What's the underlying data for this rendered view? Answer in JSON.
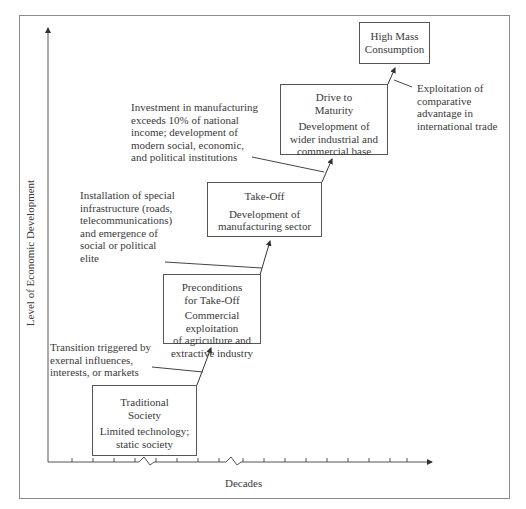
{
  "diagram": {
    "axes": {
      "y_label": "Level of Economic Development",
      "x_label": "Decades"
    },
    "stages": [
      {
        "id": "traditional",
        "title": "Traditional Society",
        "title_lines": [
          "Traditional",
          "Society"
        ],
        "desc_lines": [
          "Limited technology;",
          "static society"
        ]
      },
      {
        "id": "preconditions",
        "title": "Preconditions for Take-Off",
        "title_lines": [
          "Preconditions",
          "for Take-Off"
        ],
        "desc_lines": [
          "Commercial",
          "exploitation",
          "of agriculture and",
          "extractive industry"
        ]
      },
      {
        "id": "takeoff",
        "title": "Take-Off",
        "title_lines": [
          "Take-Off"
        ],
        "desc_lines": [
          "Development of",
          "manufacturing sector"
        ]
      },
      {
        "id": "maturity",
        "title": "Drive to Maturity",
        "title_lines": [
          "Drive to",
          "Maturity"
        ],
        "desc_lines": [
          "Development of",
          "wider industrial and",
          "commercial base"
        ]
      },
      {
        "id": "highmass",
        "title": "High Mass Consumption",
        "title_lines": [
          "High Mass",
          "Consumption"
        ],
        "desc_lines": []
      }
    ],
    "transitions": [
      {
        "from": "traditional",
        "to": "preconditions",
        "lines": [
          "Transition triggered by",
          "exernal influences,",
          "interests, or markets"
        ]
      },
      {
        "from": "preconditions",
        "to": "takeoff",
        "lines": [
          "Installation of special",
          "infrastructure (roads,",
          "telecommunications)",
          "and emergence of",
          "social or political",
          "elite"
        ]
      },
      {
        "from": "takeoff",
        "to": "maturity",
        "lines": [
          "Investment in manufacturing",
          "exceeds 10% of national",
          "income; development of",
          "modern social, economic,",
          "and political institutions"
        ]
      },
      {
        "from": "maturity",
        "to": "highmass",
        "lines": [
          "Exploitation of",
          "comparative",
          "advantage in",
          "international trade"
        ]
      }
    ]
  }
}
